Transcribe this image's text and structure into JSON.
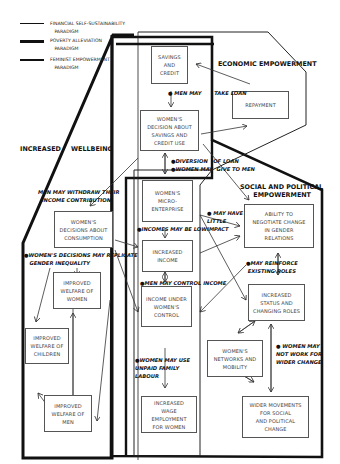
{
  "legend": [
    {
      "label": "FINANCIAL SELF-SUSTAINABILITY\n   PARADIGM",
      "line": "thin"
    },
    {
      "label": "POVERTY ALLEVIATION\n   PARADIGM",
      "line": "thick"
    },
    {
      "label": "FEMINIST EMPOWERMENT\n   PARADIGM",
      "line": "medium"
    }
  ],
  "headings": {
    "economic": "ECONOMIC EMPOWERMENT",
    "wellbeing_1": "INCREASED",
    "wellbeing_2": "WELLBEING",
    "social": "SOCIAL AND POLITICAL\n      EMPOWERMENT"
  },
  "boxes": {
    "savings_credit": "SAVINGS\nAND\nCREDIT",
    "repayment": "REPAYMENT",
    "decision_savings": "WOMEN'S\nDECISION ABOUT\nSAVINGS AND\nCREDIT USE",
    "micro_enterprise": "WOMEN'S\nMICRO-\nENTERPRISE",
    "decisions_consumption": "WOMEN'S\nDECISIONS ABOUT\nCONSUMPTION",
    "increased_income": "INCREASED\nINCOME",
    "welfare_women": "IMPROVED\nWELFARE OF\nWOMEN",
    "income_control": "INCOME UNDER\nWOMEN'S\nCONTROL",
    "welfare_children": "IMPROVED\nWELFARE OF\nCHILDREN",
    "welfare_men": "IMPROVED\nWELFARE OF\nMEN",
    "wage_employment": "INCREASED\nWAGE\nEMPLOYMENT\nFOR WOMEN",
    "negotiate": "ABILITY TO\nNEGOTIATE CHANGE\nIN GENDER\nRELATIONS",
    "status_roles": "INCREASED\nSTATUS AND\nCHANGING ROLES",
    "networks": "WOMEN'S\nNETWORKS AND\nMOBILITY",
    "movements": "WIDER MOVEMENTS\nFOR SOCIAL\nAND POLITICAL\nCHANGE"
  },
  "notes": {
    "men_take_loan": "● MEN MAY       TAKE LOAN",
    "diversion": "●DIVERSION   OF LOAN\n●WOMEN MAY  GIVE TO MEN",
    "men_withdraw": "MEN MAY WITHDRAW THEIR\n  INCOME CONTRIBUTION",
    "little_impact": "● MAY HAVE\nLITTLE\nIMPACT",
    "income_low": "●INCOMES MAY BE LOW",
    "replicate": "●WOMEN'S DECISIONS MAY REPLICATE\n   GENDER INEQUALITY",
    "reinforce": "●MAY REINFORCE\n EXISTING ROLES",
    "men_control": "●MEN MAY CONTROL INCOME",
    "unpaid_labour": "●WOMEN MAY USE\nUNPAID FAMILY\nLABOUR",
    "not_work": "● WOMEN MAY\nNOT WORK FOR\nWIDER CHANGE"
  }
}
